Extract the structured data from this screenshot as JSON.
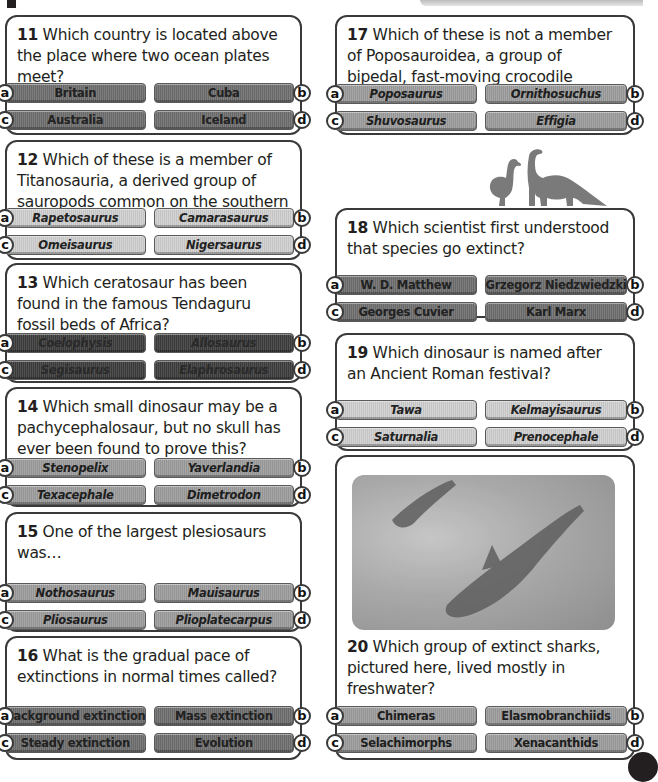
{
  "questions": [
    {
      "number": "11",
      "text": " Which country is located above the place where two ocean plates meet?",
      "style": "dark",
      "italic": false,
      "answers": [
        {
          "letter": "a",
          "label": "Britain"
        },
        {
          "letter": "b",
          "label": "Cuba"
        },
        {
          "letter": "c",
          "label": "Australia"
        },
        {
          "letter": "d",
          "label": "Iceland"
        }
      ]
    },
    {
      "number": "12",
      "text": " Which of these is a member of Titanosauria, a derived group of sauropods common on the southern continents?",
      "style": "light",
      "italic": true,
      "answers": [
        {
          "letter": "a",
          "label": "Rapetosaurus"
        },
        {
          "letter": "b",
          "label": "Camarasaurus"
        },
        {
          "letter": "c",
          "label": "Omeisaurus"
        },
        {
          "letter": "d",
          "label": "Nigersaurus"
        }
      ]
    },
    {
      "number": "13",
      "text": " Which ceratosaur has been found in the famous Tendaguru fossil beds of Africa?",
      "style": "vdark",
      "italic": true,
      "answers": [
        {
          "letter": "a",
          "label": "Coelophysis"
        },
        {
          "letter": "b",
          "label": "Allosaurus"
        },
        {
          "letter": "c",
          "label": "Segisaurus"
        },
        {
          "letter": "d",
          "label": "Elaphrosaurus"
        }
      ]
    },
    {
      "number": "14",
      "text": " Which small dinosaur may be a pachycephalosaur, but no skull has ever been found to prove this?",
      "style": "mid",
      "italic": true,
      "answers": [
        {
          "letter": "a",
          "label": "Stenopelix"
        },
        {
          "letter": "b",
          "label": "Yaverlandia"
        },
        {
          "letter": "c",
          "label": "Texacephale"
        },
        {
          "letter": "d",
          "label": "Dimetrodon"
        }
      ]
    },
    {
      "number": "15",
      "text": " One of the largest plesiosaurs was…",
      "style": "mid",
      "italic": true,
      "answers": [
        {
          "letter": "a",
          "label": "Nothosaurus"
        },
        {
          "letter": "b",
          "label": "Mauisaurus"
        },
        {
          "letter": "c",
          "label": "Pliosaurus"
        },
        {
          "letter": "d",
          "label": "Plioplatecarpus"
        }
      ]
    },
    {
      "number": "16",
      "text": " What is the gradual pace of extinctions in normal times called?",
      "style": "dark",
      "italic": false,
      "answers": [
        {
          "letter": "a",
          "label": "Background extinction"
        },
        {
          "letter": "b",
          "label": "Mass extinction"
        },
        {
          "letter": "c",
          "label": "Steady extinction"
        },
        {
          "letter": "d",
          "label": "Evolution"
        }
      ]
    },
    {
      "number": "17",
      "text": " Which of these is not a member of Poposauroidea, a group of bipedal, fast-moving crocodile relatives?",
      "style": "mid",
      "italic": true,
      "answers": [
        {
          "letter": "a",
          "label": "Poposaurus"
        },
        {
          "letter": "b",
          "label": "Ornithosuchus"
        },
        {
          "letter": "c",
          "label": "Shuvosaurus"
        },
        {
          "letter": "d",
          "label": "Effigia"
        }
      ]
    },
    {
      "number": "18",
      "text": " Which scientist first understood that species go extinct?",
      "style": "dark",
      "italic": false,
      "answers": [
        {
          "letter": "a",
          "label": "W. D. Matthew"
        },
        {
          "letter": "b",
          "label": "Grzegorz Niedzwiedzki"
        },
        {
          "letter": "c",
          "label": "Georges Cuvier"
        },
        {
          "letter": "d",
          "label": "Karl Marx"
        }
      ]
    },
    {
      "number": "19",
      "text": " Which dinosaur is named after an Ancient Roman festival?",
      "style": "light",
      "italic": true,
      "answers": [
        {
          "letter": "a",
          "label": "Tawa"
        },
        {
          "letter": "b",
          "label": "Kelmayisaurus"
        },
        {
          "letter": "c",
          "label": "Saturnalia"
        },
        {
          "letter": "d",
          "label": "Prenocephale"
        }
      ]
    },
    {
      "number": "20",
      "text": " Which group of extinct sharks, pictured here, lived mostly in freshwater?",
      "style": "mid",
      "italic": false,
      "answers": [
        {
          "letter": "a",
          "label": "Chimeras"
        },
        {
          "letter": "b",
          "label": "Elasmobranchiids"
        },
        {
          "letter": "c",
          "label": "Selachimorphs"
        },
        {
          "letter": "d",
          "label": "Xenacanthids"
        }
      ]
    }
  ],
  "illustrations": {
    "silhouette": "dodo-and-sauropod-silhouette",
    "photo": "xenacanth-sharks-underwater-illustration"
  }
}
